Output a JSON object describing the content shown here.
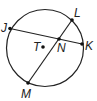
{
  "diagram": {
    "type": "circle-geometry",
    "circle": {
      "center_label": "T",
      "stroke_color": "#222222"
    },
    "points": [
      {
        "label": "J",
        "role": "chord endpoint on circle"
      },
      {
        "label": "K",
        "role": "chord endpoint on circle"
      },
      {
        "label": "L",
        "role": "chord endpoint on circle"
      },
      {
        "label": "M",
        "role": "chord endpoint on circle"
      },
      {
        "label": "N",
        "role": "intersection of chords JK and LM"
      },
      {
        "label": "T",
        "role": "center of circle"
      }
    ],
    "segments": [
      {
        "from": "J",
        "to": "K"
      },
      {
        "from": "L",
        "to": "M"
      }
    ],
    "labels": {
      "J": "J",
      "K": "K",
      "L": "L",
      "M": "M",
      "N": "N",
      "T": "T"
    }
  }
}
